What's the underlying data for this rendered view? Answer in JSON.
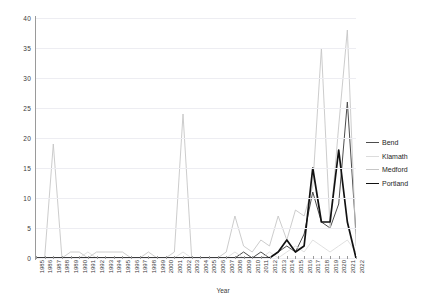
{
  "chart_data": {
    "type": "line",
    "title": "",
    "xlabel": "Year",
    "ylabel": "",
    "ylim": [
      0,
      40
    ],
    "yticks": [
      0,
      5,
      10,
      15,
      20,
      25,
      30,
      35,
      40
    ],
    "grid": true,
    "legend_position": "right",
    "categories": [
      "1985",
      "1986",
      "1987",
      "1988",
      "1989",
      "1990",
      "1991",
      "1992",
      "1993",
      "1994",
      "1995",
      "1996",
      "1997",
      "1998",
      "1999",
      "2000",
      "2001",
      "2002",
      "2003",
      "2004",
      "2005",
      "2006",
      "2007",
      "2008",
      "2009",
      "2010",
      "2011",
      "2012",
      "2013",
      "2014",
      "2015",
      "2016",
      "2017",
      "2018",
      "2019",
      "2020",
      "2021",
      "2022"
    ],
    "series": [
      {
        "name": "Bend",
        "color": "#4d4d4d",
        "width": 1.0,
        "values": [
          0,
          0,
          0,
          0,
          0,
          0,
          0,
          0,
          0,
          0,
          0,
          0,
          0,
          0,
          0,
          0,
          0,
          0,
          0,
          0,
          0,
          0,
          0,
          0,
          1,
          0,
          1,
          0,
          1,
          2,
          1,
          4,
          11,
          6,
          5,
          9,
          26,
          4
        ]
      },
      {
        "name": "Klamath",
        "color": "#dcdcdc",
        "width": 0.9,
        "values": [
          0,
          0,
          0,
          0,
          0,
          0,
          1,
          0,
          0,
          0,
          0,
          0,
          0,
          0,
          0,
          0,
          0,
          1,
          0,
          0,
          0,
          0,
          0,
          1,
          0,
          0,
          0,
          1,
          0,
          1,
          2,
          1,
          3,
          2,
          1,
          2,
          3,
          1
        ]
      },
      {
        "name": "Medford",
        "color": "#c6c6c6",
        "width": 0.9,
        "values": [
          0,
          0,
          19,
          0,
          1,
          1,
          0,
          1,
          1,
          1,
          1,
          0,
          0,
          1,
          0,
          0,
          1,
          24,
          0,
          0,
          0,
          0,
          1,
          7,
          2,
          1,
          3,
          2,
          7,
          3,
          8,
          7,
          12,
          35,
          5,
          22,
          38,
          2
        ]
      },
      {
        "name": "Portland",
        "color": "#111111",
        "width": 1.7,
        "values": [
          0,
          0,
          0,
          0,
          0,
          0,
          0,
          0,
          0,
          0,
          0,
          0,
          0,
          0,
          0,
          0,
          0,
          0,
          0,
          0,
          0,
          0,
          0,
          0,
          0,
          0,
          0,
          0,
          1,
          3,
          1,
          2,
          15,
          6,
          6,
          18,
          6,
          0
        ]
      }
    ]
  },
  "legend": {
    "entries": [
      {
        "label": "Bend"
      },
      {
        "label": "Klamath"
      },
      {
        "label": "Medford"
      },
      {
        "label": "Portland"
      }
    ]
  }
}
